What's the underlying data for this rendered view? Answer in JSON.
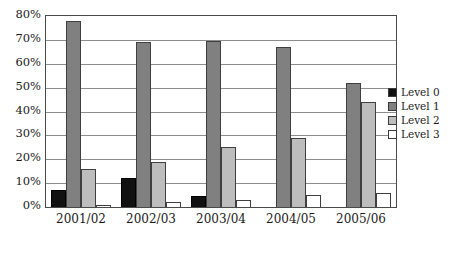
{
  "chart_data": {
    "type": "bar",
    "title": "",
    "subtitle": "",
    "xlabel": "",
    "ylabel": "",
    "categories": [
      "2001/02",
      "2002/03",
      "2003/04",
      "2004/05",
      "2005/06"
    ],
    "series": [
      {
        "name": "Level 0",
        "color": "#111111",
        "values": [
          7,
          12,
          4.5,
          0,
          0
        ]
      },
      {
        "name": "Level 1",
        "color": "#808080",
        "values": [
          78,
          69,
          69.5,
          67,
          52
        ]
      },
      {
        "name": "Level 2",
        "color": "#bdbdbd",
        "values": [
          16,
          19,
          25,
          29,
          44
        ]
      },
      {
        "name": "Level 3",
        "color": "#ffffff",
        "values": [
          1,
          2,
          3,
          5,
          6
        ]
      }
    ],
    "ylim": [
      0,
      80
    ],
    "ytick_labels": [
      "80%",
      "70%",
      "60%",
      "50%",
      "40%",
      "30%",
      "20%",
      "10%",
      "0%"
    ],
    "ytick_values": [
      80,
      70,
      60,
      50,
      40,
      30,
      20,
      10,
      0
    ],
    "grid": true,
    "legend_position": "right",
    "legend_entries": [
      "Level 0",
      "Level 1",
      "Level 2",
      "Level 3"
    ]
  }
}
